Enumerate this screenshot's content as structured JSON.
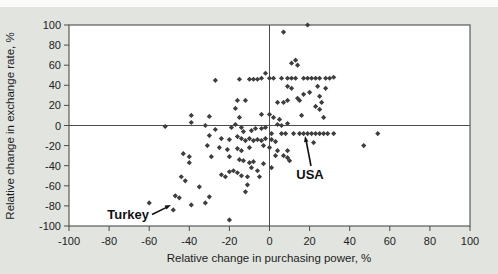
{
  "figure": {
    "bg_color": "#e1e4df",
    "plot_bg": "#ffffff",
    "frame_color": "#5a5a5a",
    "marker_color": "#3e3e3e",
    "text_color": "#1d1d1d"
  },
  "chart_data": {
    "type": "scatter",
    "title": "",
    "xlabel": "Relative change in purchasing power, %",
    "ylabel": "Relative change in exchange rate, %",
    "xlim": [
      -100,
      100
    ],
    "ylim": [
      -100,
      100
    ],
    "xticks": [
      -100,
      -80,
      -60,
      -40,
      -20,
      0,
      20,
      40,
      60,
      80,
      100
    ],
    "yticks": [
      -100,
      -80,
      -60,
      -40,
      -20,
      0,
      20,
      40,
      60,
      80,
      100
    ],
    "grid": false,
    "zero_lines": true,
    "legend": "none",
    "marker": "diamond",
    "annotations": [
      {
        "label": "Turkey",
        "point": [
          -48,
          -84
        ]
      },
      {
        "label": "USA",
        "point": [
          18,
          -8
        ]
      }
    ],
    "points": [
      [
        7,
        93
      ],
      [
        19,
        100
      ],
      [
        -2,
        52
      ],
      [
        -27,
        45
      ],
      [
        -15,
        46
      ],
      [
        -10,
        46
      ],
      [
        -8,
        46
      ],
      [
        -6,
        46
      ],
      [
        -4,
        47
      ],
      [
        0,
        47
      ],
      [
        2,
        47
      ],
      [
        6,
        47
      ],
      [
        9,
        47
      ],
      [
        11,
        47
      ],
      [
        13,
        47
      ],
      [
        17,
        47
      ],
      [
        19,
        47
      ],
      [
        21,
        47
      ],
      [
        23,
        47
      ],
      [
        25,
        47
      ],
      [
        28,
        47
      ],
      [
        30,
        47
      ],
      [
        32,
        48
      ],
      [
        11,
        62
      ],
      [
        13,
        65
      ],
      [
        14,
        60
      ],
      [
        9,
        39
      ],
      [
        11,
        37
      ],
      [
        24,
        39
      ],
      [
        28,
        37
      ],
      [
        17,
        31
      ],
      [
        20,
        33
      ],
      [
        25,
        29
      ],
      [
        14,
        27
      ],
      [
        15,
        25
      ],
      [
        9,
        25
      ],
      [
        7,
        23
      ],
      [
        4,
        23
      ],
      [
        26,
        23
      ],
      [
        23,
        19
      ],
      [
        25,
        16
      ],
      [
        27,
        8
      ],
      [
        -16,
        25
      ],
      [
        -12,
        25
      ],
      [
        -17,
        17
      ],
      [
        -39,
        10
      ],
      [
        -39,
        3
      ],
      [
        -30,
        9
      ],
      [
        -32,
        0
      ],
      [
        -15,
        8
      ],
      [
        -17,
        1
      ],
      [
        -4,
        11
      ],
      [
        0,
        11
      ],
      [
        2,
        8
      ],
      [
        5,
        6
      ],
      [
        9,
        2
      ],
      [
        6,
        0
      ],
      [
        4,
        1
      ],
      [
        16,
        10
      ],
      [
        -2,
        -2
      ],
      [
        -52,
        -1
      ],
      [
        -27,
        -4
      ],
      [
        -19,
        -2
      ],
      [
        -14,
        -2
      ],
      [
        -13,
        -6
      ],
      [
        -9,
        -5
      ],
      [
        -7,
        -3
      ],
      [
        -4,
        -3
      ],
      [
        -30,
        -10
      ],
      [
        -24,
        -13
      ],
      [
        -20,
        -14
      ],
      [
        -16,
        -11
      ],
      [
        -14,
        -13
      ],
      [
        -12,
        -15
      ],
      [
        -10,
        -13
      ],
      [
        -8,
        -15
      ],
      [
        -6,
        -14
      ],
      [
        -4,
        -15
      ],
      [
        -2,
        -13
      ],
      [
        1,
        -8
      ],
      [
        6,
        -8
      ],
      [
        8,
        -8
      ],
      [
        12,
        -8
      ],
      [
        15,
        -8
      ],
      [
        17,
        -8
      ],
      [
        19,
        -8
      ],
      [
        21,
        -8
      ],
      [
        23,
        -8
      ],
      [
        25,
        -8
      ],
      [
        27,
        -8
      ],
      [
        29,
        -8
      ],
      [
        32,
        -8
      ],
      [
        -31,
        -20
      ],
      [
        -25,
        -22
      ],
      [
        -21,
        -24
      ],
      [
        -16,
        -23
      ],
      [
        -14,
        -25
      ],
      [
        -10,
        -22
      ],
      [
        -3,
        -20
      ],
      [
        -29,
        -31
      ],
      [
        -20,
        -31
      ],
      [
        -15,
        -34
      ],
      [
        -13,
        -35
      ],
      [
        -10,
        -37
      ],
      [
        -8,
        -36
      ],
      [
        -3,
        -38
      ],
      [
        -43,
        -28
      ],
      [
        -40,
        -31
      ],
      [
        -40,
        -37
      ],
      [
        1,
        -14
      ],
      [
        3,
        -16
      ],
      [
        0,
        -22
      ],
      [
        4,
        -25
      ],
      [
        9,
        -25
      ],
      [
        3,
        -30
      ],
      [
        7,
        -30
      ],
      [
        9,
        -32
      ],
      [
        10,
        -35
      ],
      [
        1,
        -42
      ],
      [
        22,
        -17
      ],
      [
        47,
        -20
      ],
      [
        54,
        -8
      ],
      [
        -24,
        -49
      ],
      [
        -22,
        -51
      ],
      [
        -20,
        -46
      ],
      [
        -18,
        -45
      ],
      [
        -16,
        -47
      ],
      [
        -14,
        -50
      ],
      [
        -11,
        -51
      ],
      [
        -9,
        -42
      ],
      [
        -6,
        -45
      ],
      [
        -5,
        -51
      ],
      [
        -11,
        -59
      ],
      [
        -12,
        -66
      ],
      [
        -35,
        -61
      ],
      [
        -30,
        -71
      ],
      [
        -32,
        -77
      ],
      [
        -39,
        -79
      ],
      [
        -47,
        -70
      ],
      [
        -45,
        -72
      ],
      [
        -48,
        -84
      ],
      [
        -44,
        -51
      ],
      [
        -42,
        -55
      ],
      [
        -60,
        -77
      ],
      [
        -20,
        -94
      ]
    ]
  }
}
